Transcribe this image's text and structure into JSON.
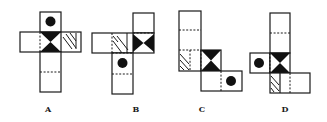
{
  "figure": {
    "options": [
      {
        "label": "A",
        "faces": [
          "circle",
          "bowtie",
          "hatched",
          "blank",
          "blank",
          "blank"
        ]
      },
      {
        "label": "B",
        "faces": [
          "blank",
          "bowtie",
          "hatched",
          "circle",
          "blank",
          "blank"
        ]
      },
      {
        "label": "C",
        "faces": [
          "blank",
          "blank",
          "hatched",
          "bowtie",
          "blank",
          "circle"
        ]
      },
      {
        "label": "D",
        "faces": [
          "blank",
          "blank",
          "circle",
          "bowtie",
          "hatched",
          "blank"
        ]
      }
    ]
  },
  "labels": {
    "a": "A",
    "b": "B",
    "c": "C",
    "d": "D"
  },
  "colors": {
    "ink": "#111111",
    "background": "#ffffff"
  }
}
